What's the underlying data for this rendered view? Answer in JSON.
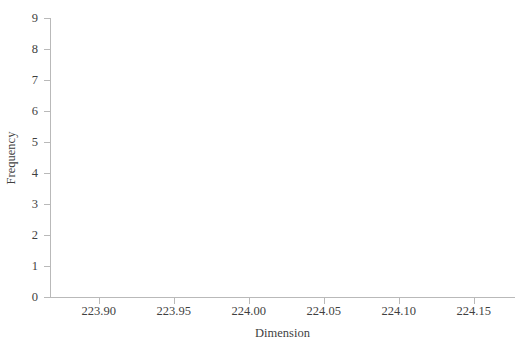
{
  "chart_data": {
    "type": "bar",
    "title": "",
    "subtitle": "",
    "xlabel": "Dimension",
    "ylabel": "Frequency",
    "categories": [],
    "values": [],
    "series": [],
    "xlim": [
      223.8675,
      224.1775
    ],
    "ylim": [
      0,
      9
    ],
    "x_tick_values": [
      223.9,
      223.95,
      224.0,
      224.05,
      224.1,
      224.15
    ],
    "x_tick_labels": [
      "223.90",
      "223.95",
      "224.00",
      "224.05",
      "224.10",
      "224.15"
    ],
    "y_tick_values": [
      0,
      1,
      2,
      3,
      4,
      5,
      6,
      7,
      8,
      9
    ],
    "y_tick_labels": [
      "0",
      "1",
      "2",
      "3",
      "4",
      "5",
      "6",
      "7",
      "8",
      "9"
    ],
    "grid": false,
    "legend": false,
    "legend_position": "none",
    "annotations": [],
    "note": "Histogram frame rendered with axes and labels only; no bars are drawn in the plot area."
  },
  "axes": {
    "y_title": "Frequency",
    "x_title": "Dimension"
  },
  "style": {
    "background": "#ffffff",
    "axis_color": "#b9b9b9",
    "text_color": "#3f3f3f",
    "bar_fill": "#9aa7b4",
    "bar_stroke": "#6e7b88"
  }
}
